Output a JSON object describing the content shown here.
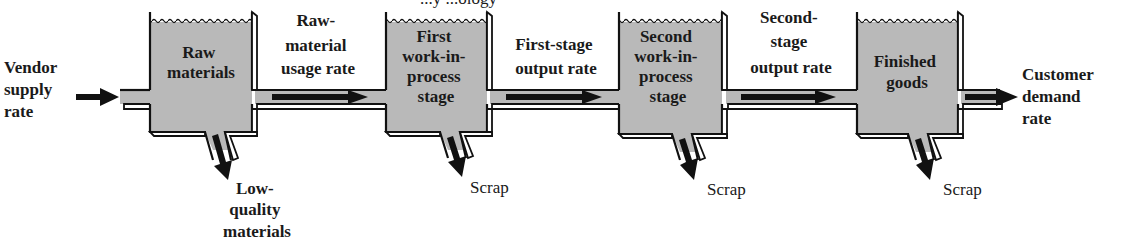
{
  "title_fragment": "...y ...ology",
  "colors": {
    "tank_fill": "#b9b9b9",
    "outline": "#111111",
    "arrow": "#111111",
    "background": "#ffffff"
  },
  "inputs": {
    "vendor_supply_rate": [
      "Vendor",
      "supply",
      "rate"
    ]
  },
  "tanks": [
    {
      "id": "raw-materials",
      "label": [
        "Raw",
        "materials"
      ],
      "drain_label": [
        "Low-",
        "quality",
        "materials"
      ]
    },
    {
      "id": "first-wip",
      "label": [
        "First",
        "work-in-",
        "process",
        "stage"
      ],
      "drain_label": [
        "Scrap"
      ]
    },
    {
      "id": "second-wip",
      "label": [
        "Second",
        "work-in-",
        "process",
        "stage"
      ],
      "drain_label": [
        "Scrap"
      ]
    },
    {
      "id": "finished-goods",
      "label": [
        "Finished",
        "goods"
      ],
      "drain_label": [
        "Scrap"
      ]
    }
  ],
  "flows": [
    {
      "id": "raw-material-usage-rate",
      "label": [
        "Raw-",
        "material",
        "usage rate"
      ]
    },
    {
      "id": "first-stage-output-rate",
      "label": [
        "First-stage",
        "output rate"
      ]
    },
    {
      "id": "second-stage-output-rate",
      "label": [
        "Second-",
        "stage",
        "output rate"
      ]
    }
  ],
  "outputs": {
    "customer_demand_rate": [
      "Customer",
      "demand",
      "rate"
    ]
  }
}
